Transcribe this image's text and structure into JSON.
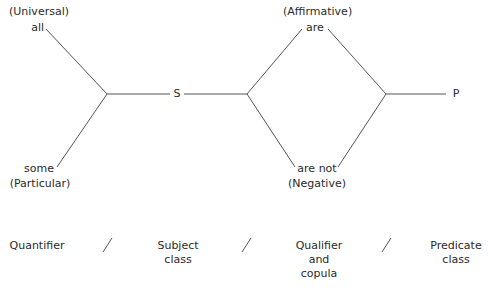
{
  "diagram": {
    "quantifier": {
      "universal_label": "(Universal)",
      "universal_word": "all",
      "particular_word": "some",
      "particular_label": "(Particular)"
    },
    "subject_node": "S",
    "qualifier": {
      "affirmative_label": "(Affirmative)",
      "affirmative_word": "are",
      "negative_word": "are not",
      "negative_label": "(Negative)"
    },
    "predicate_node": "P",
    "line_color": "#555555"
  },
  "captions": {
    "items": [
      {
        "line1": "Quantifier",
        "line2": "",
        "line3": ""
      },
      {
        "line1": "Subject",
        "line2": "class",
        "line3": ""
      },
      {
        "line1": "Qualifier",
        "line2": "and",
        "line3": "copula"
      },
      {
        "line1": "Predicate",
        "line2": "class",
        "line3": ""
      }
    ],
    "separator": "/"
  }
}
